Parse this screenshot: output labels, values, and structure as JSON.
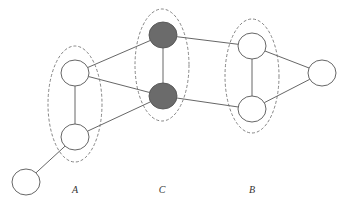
{
  "diagram": {
    "colors": {
      "background": "#ffffff",
      "edge": "#555555",
      "node_fill_default": "#ffffff",
      "node_fill_highlight": "#6b6b6b",
      "group_stroke": "#777777"
    },
    "groups": [
      {
        "id": "A",
        "label": "A",
        "cx": 75,
        "cy": 104,
        "rx": 27,
        "ry": 58,
        "label_x": 75,
        "label_y": 193
      },
      {
        "id": "C",
        "label": "C",
        "cx": 162,
        "cy": 65,
        "rx": 27,
        "ry": 56,
        "label_x": 162,
        "label_y": 193
      },
      {
        "id": "B",
        "label": "B",
        "cx": 252,
        "cy": 76,
        "rx": 27,
        "ry": 57,
        "label_x": 252,
        "label_y": 193
      }
    ],
    "nodes": [
      {
        "id": "a1",
        "group": "A",
        "cx": 75,
        "cy": 73,
        "rx": 14,
        "ry": 13,
        "filled": false
      },
      {
        "id": "a2",
        "group": "A",
        "cx": 75,
        "cy": 137,
        "rx": 14,
        "ry": 13,
        "filled": false
      },
      {
        "id": "c1",
        "group": "C",
        "cx": 163,
        "cy": 35,
        "rx": 14,
        "ry": 13,
        "filled": true
      },
      {
        "id": "c2",
        "group": "C",
        "cx": 163,
        "cy": 96,
        "rx": 14,
        "ry": 13,
        "filled": true
      },
      {
        "id": "b1",
        "group": "B",
        "cx": 252,
        "cy": 46,
        "rx": 14,
        "ry": 13,
        "filled": false
      },
      {
        "id": "b2",
        "group": "B",
        "cx": 252,
        "cy": 109,
        "rx": 14,
        "ry": 13,
        "filled": false
      },
      {
        "id": "r",
        "group": null,
        "cx": 322,
        "cy": 73,
        "rx": 14,
        "ry": 13,
        "filled": false
      },
      {
        "id": "l",
        "group": null,
        "cx": 26,
        "cy": 182,
        "rx": 14,
        "ry": 13,
        "filled": false
      }
    ],
    "edges": [
      [
        "a1",
        "a2"
      ],
      [
        "a1",
        "c1"
      ],
      [
        "a1",
        "c2"
      ],
      [
        "a2",
        "c2"
      ],
      [
        "a2",
        "l"
      ],
      [
        "c1",
        "c2"
      ],
      [
        "c1",
        "b1"
      ],
      [
        "c2",
        "b2"
      ],
      [
        "b1",
        "b2"
      ],
      [
        "b1",
        "r"
      ],
      [
        "b2",
        "r"
      ]
    ]
  }
}
